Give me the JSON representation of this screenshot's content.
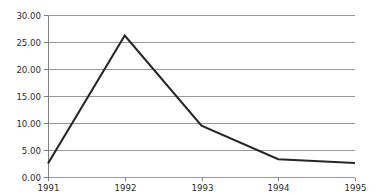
{
  "chart_data": {
    "type": "line",
    "title": "",
    "subtitle": "",
    "xlabel": "",
    "ylabel": "",
    "categories": [
      "1991",
      "1992",
      "1993",
      "1994",
      "1995"
    ],
    "x": [
      1991,
      1992,
      1993,
      1994,
      1995
    ],
    "values": [
      2.5,
      26.2,
      9.5,
      3.3,
      2.6
    ],
    "series": [
      {
        "name": "",
        "values": [
          2.5,
          26.2,
          9.5,
          3.3,
          2.6
        ]
      }
    ],
    "ylim": [
      0.0,
      30.0
    ],
    "yticks": [
      0.0,
      5.0,
      10.0,
      15.0,
      20.0,
      25.0,
      30.0
    ],
    "ytick_labels": [
      "0.00",
      "5.00",
      "10.00",
      "15.00",
      "20.00",
      "25.00",
      "30.00"
    ],
    "xtick_labels": [
      "1991",
      "1992",
      "1993",
      "1994",
      "1995"
    ],
    "grid": true,
    "grid_axis": "y",
    "legend": false,
    "legend_position": "none",
    "annotations": []
  },
  "style": {
    "background": "#ffffff",
    "grid_color": "#999999",
    "axis_color": "#808080",
    "series_color": "#262626",
    "label_color": "#2b2b2b",
    "series_width": 2.1,
    "grid_width": 1
  },
  "geometry": {
    "plot_left": 48,
    "plot_right": 355,
    "plot_top": 15,
    "plot_bottom": 177
  }
}
